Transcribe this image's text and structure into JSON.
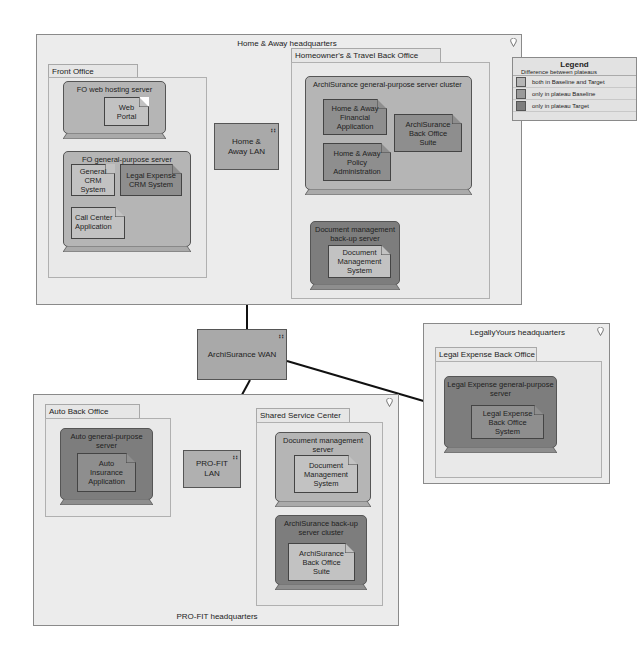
{
  "diagram": {
    "locations": {
      "home_away_hq": "Home & Away headquarters",
      "pro_fit_hq": "PRO-FIT headquarters",
      "legally_yours_hq": "LegallyYours headquarters"
    },
    "groups": {
      "front_office": "Front Office",
      "homeowners_travel_back_office": "Homeowner's & Travel Back Office",
      "auto_back_office": "Auto Back Office",
      "shared_service_center": "Shared Service Center",
      "legal_expense_back_office": "Legal Expense Back Office"
    },
    "nodes": {
      "fo_web_hosting_server": "FO web hosting server",
      "fo_general_purpose_server": "FO general-purpose server",
      "archisurance_gp_cluster": "ArchiSurance general-purpose server cluster",
      "doc_mgmt_backup_server": "Document management back-up server",
      "auto_gp_server": "Auto general-purpose server",
      "doc_mgmt_server": "Document management server",
      "archisurance_backup_cluster": "ArchiSurance back-up server cluster",
      "legal_expense_gp_server": "Legal Expense general-purpose server"
    },
    "artifacts": {
      "web_portal": "Web Portal",
      "general_crm": "General CRM System",
      "legal_expense_crm": "Legal Expense CRM System",
      "call_center": "Call Center Application",
      "ha_financial": "Home & Away Financial Application",
      "ha_policy": "Home & Away Policy Administration",
      "archisurance_bos_1": "ArchiSurance Back Office Suite",
      "dms_1": "Document Management System",
      "auto_insurance": "Auto Insurance Application",
      "dms_2": "Document Management System",
      "archisurance_bos_2": "ArchiSurance Back Office Suite",
      "legal_expense_bos": "Legal Expense Back Office System"
    },
    "networks": {
      "home_away_lan": "Home & Away LAN",
      "archisurance_wan": "ArchiSurance WAN",
      "pro_fit_lan": "PRO-FIT LAN"
    },
    "network_icon": "∷"
  },
  "legend": {
    "title": "Legend",
    "subtitle": "Difference between plateaus",
    "items": [
      {
        "label": "both in Baseline and Target",
        "color": "#b5b5b5"
      },
      {
        "label": "only in plateau Baseline",
        "color": "#9a9a9a"
      },
      {
        "label": "only in plateau Target",
        "color": "#7d7d7d"
      }
    ]
  }
}
